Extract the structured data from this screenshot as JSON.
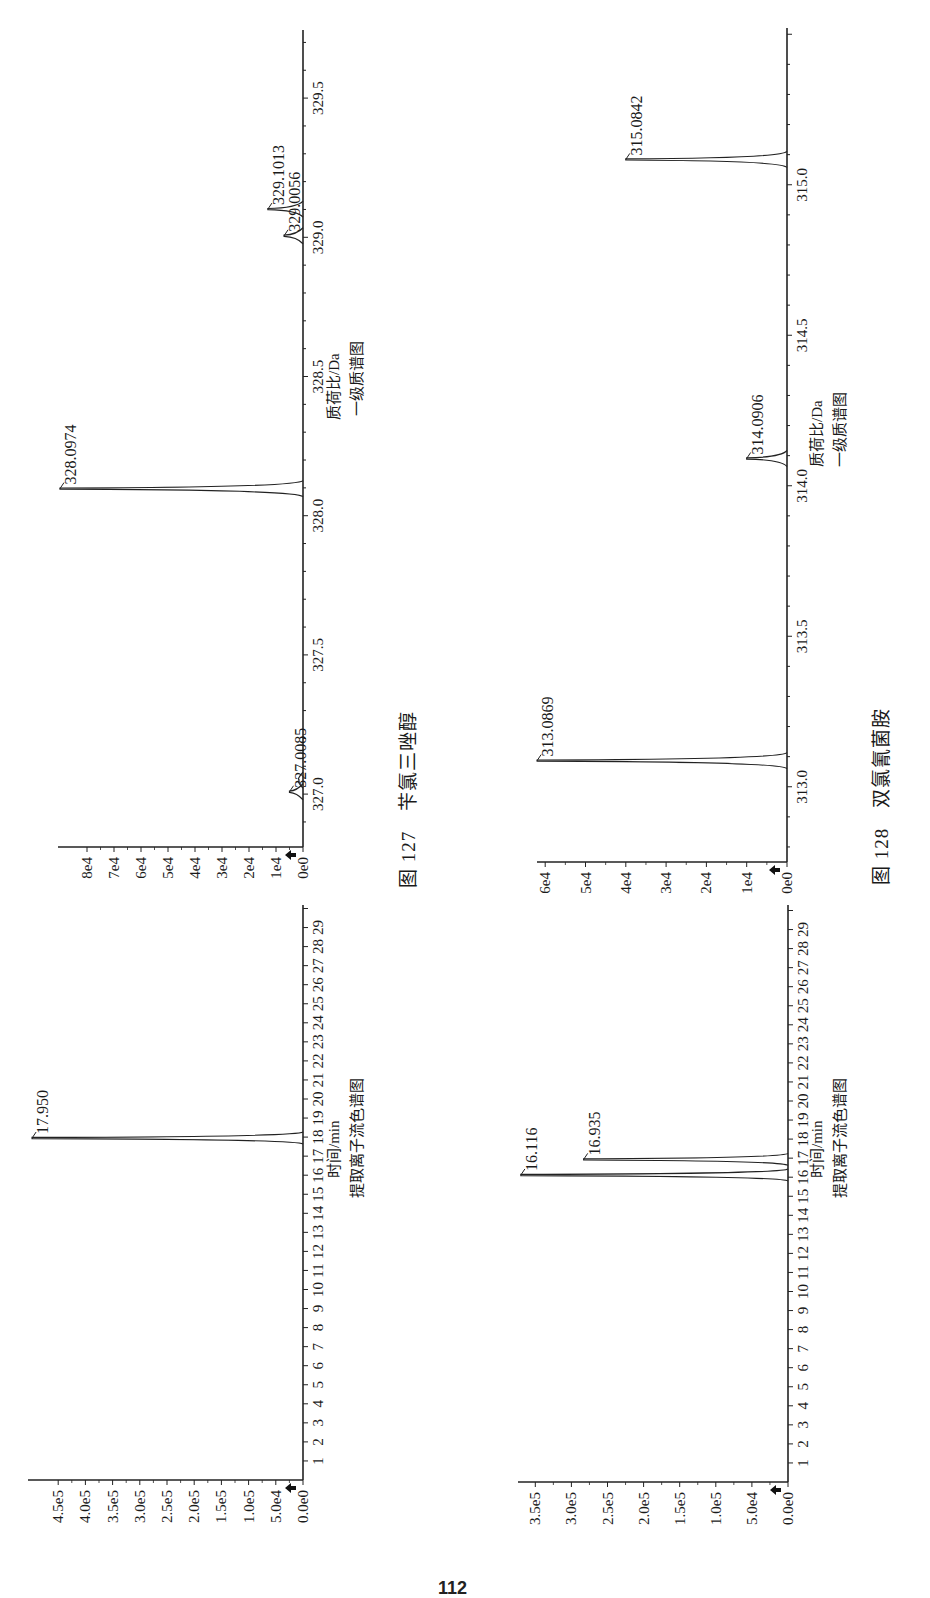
{
  "page": {
    "page_number": "112",
    "figures": [
      {
        "caption_number": "图 127",
        "caption_name": "苄氯三唑醇",
        "caption": "图 127　苄氯三唑醇"
      },
      {
        "caption_number": "图 128",
        "caption_name": "双氯氰菌胺",
        "caption": "图 128　双氯氰菌胺"
      }
    ]
  },
  "chart_data": [
    {
      "id": "fig127-xic",
      "figure": "图 127 苄氯三唑醇",
      "type": "line",
      "title": "提取离子流色谱图",
      "xlabel": "时间/min",
      "ylabel": "",
      "x_ticks": [
        1,
        2,
        3,
        4,
        5,
        6,
        7,
        8,
        9,
        10,
        11,
        12,
        13,
        14,
        15,
        16,
        17,
        18,
        19,
        20,
        21,
        22,
        23,
        24,
        25,
        26,
        27,
        28,
        29
      ],
      "y_ticks": [
        "0.0e0",
        "5.0e4",
        "1.0e5",
        "1.5e5",
        "2.0e5",
        "2.5e5",
        "3.0e5",
        "3.5e5",
        "4.0e5",
        "4.5e5"
      ],
      "y_tick_values": [
        0,
        50000,
        100000,
        150000,
        200000,
        250000,
        300000,
        350000,
        400000,
        450000
      ],
      "xlim": [
        0,
        29.5
      ],
      "ylim": [
        0,
        500000
      ],
      "peaks": [
        {
          "x": 17.95,
          "label": "17.950",
          "height": 498000
        }
      ],
      "grid": false,
      "legend": null
    },
    {
      "id": "fig127-ms",
      "figure": "图 127 苄氯三唑醇",
      "type": "line",
      "title": "一级质谱图",
      "xlabel": "质荷比/Da",
      "ylabel": "",
      "x_ticks": [
        "327.0",
        "327.5",
        "328.0",
        "328.5",
        "329.0",
        "329.5"
      ],
      "x_tick_values": [
        327.0,
        327.5,
        328.0,
        328.5,
        329.0,
        329.5
      ],
      "y_ticks": [
        "0e0",
        "1e4",
        "2e4",
        "3e4",
        "4e4",
        "5e4",
        "6e4",
        "7e4",
        "8e4"
      ],
      "y_tick_values": [
        0,
        10000,
        20000,
        30000,
        40000,
        50000,
        60000,
        70000,
        80000
      ],
      "xlim": [
        326.81,
        329.74
      ],
      "ylim": [
        0,
        90000
      ],
      "peaks": [
        {
          "x": 327.0085,
          "label": "327.0085",
          "height": 5000
        },
        {
          "x": 327.05,
          "label": "",
          "height": 1500
        },
        {
          "x": 328.0974,
          "label": "328.0974",
          "height": 90000
        },
        {
          "x": 329.0056,
          "label": "329.0056",
          "height": 7000
        },
        {
          "x": 329.1013,
          "label": "329.1013",
          "height": 13000
        }
      ],
      "grid": false,
      "legend": null
    },
    {
      "id": "fig128-xic",
      "figure": "图 128 双氯氰菌胺",
      "type": "line",
      "title": "提取离子流色谱图",
      "xlabel": "时间/min",
      "ylabel": "",
      "x_ticks": [
        1,
        2,
        3,
        4,
        5,
        6,
        7,
        8,
        9,
        10,
        11,
        12,
        13,
        14,
        15,
        16,
        17,
        18,
        19,
        20,
        21,
        22,
        23,
        24,
        25,
        26,
        27,
        28,
        29
      ],
      "y_ticks": [
        "0.0e0",
        "5.0e4",
        "1.0e5",
        "1.5e5",
        "2.0e5",
        "2.5e5",
        "3.0e5",
        "3.5e5"
      ],
      "y_tick_values": [
        0,
        50000,
        100000,
        150000,
        200000,
        250000,
        300000,
        350000
      ],
      "xlim": [
        0,
        29.5
      ],
      "ylim": [
        0,
        370000
      ],
      "peaks": [
        {
          "x": 16.116,
          "label": "16.116",
          "height": 370000
        },
        {
          "x": 16.935,
          "label": "16.935",
          "height": 283000
        }
      ],
      "grid": false,
      "legend": null
    },
    {
      "id": "fig128-ms",
      "figure": "图 128 双氯氰菌胺",
      "type": "line",
      "title": "一级质谱图",
      "xlabel": "质荷比/Da",
      "ylabel": "",
      "x_ticks": [
        "313.0",
        "313.5",
        "314.0",
        "314.5",
        "315.0"
      ],
      "x_tick_values": [
        313.0,
        313.5,
        314.0,
        314.5,
        315.0
      ],
      "y_ticks": [
        "0e0",
        "1e4",
        "2e4",
        "3e4",
        "4e4",
        "5e4",
        "6e4"
      ],
      "y_tick_values": [
        0,
        10000,
        20000,
        30000,
        40000,
        50000,
        60000
      ],
      "xlim": [
        312.75,
        315.52
      ],
      "ylim": [
        0,
        62000
      ],
      "peaks": [
        {
          "x": 313.0869,
          "label": "313.0869",
          "height": 62000
        },
        {
          "x": 314.0906,
          "label": "314.0906",
          "height": 10000
        },
        {
          "x": 315.0842,
          "label": "315.0842",
          "height": 40000
        }
      ],
      "grid": false,
      "legend": null
    }
  ]
}
